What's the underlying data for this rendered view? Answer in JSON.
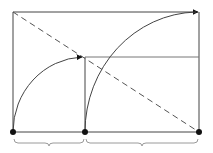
{
  "diagram": {
    "title": "",
    "colors": {
      "stroke": "#333333",
      "dot": "#111111",
      "background": "#ffffff",
      "brace": "#9a9a9a"
    },
    "points": [
      {
        "id": "A",
        "x": 13,
        "y": 132,
        "label": ""
      },
      {
        "id": "B",
        "x": 85,
        "y": 132,
        "label": ""
      },
      {
        "id": "C",
        "x": 199,
        "y": 132,
        "label": ""
      }
    ],
    "braces": [
      {
        "from": "A",
        "to": "B",
        "label": ""
      },
      {
        "from": "B",
        "to": "C",
        "label": ""
      }
    ]
  }
}
